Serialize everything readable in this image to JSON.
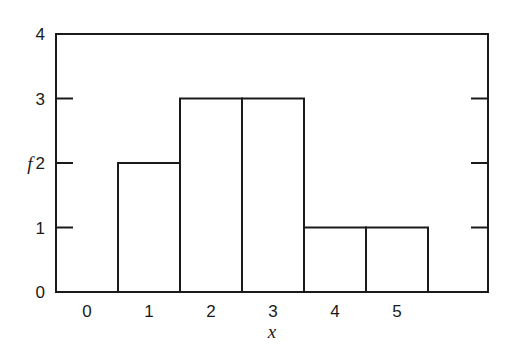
{
  "chart_data": {
    "type": "bar",
    "subtype": "histogram",
    "title": "",
    "xlabel": "x",
    "ylabel": "f",
    "categories": [
      "1",
      "2",
      "3",
      "4",
      "5"
    ],
    "values": [
      2,
      3,
      3,
      1,
      1
    ],
    "x_tick_labels": [
      "0",
      "1",
      "2",
      "3",
      "4",
      "5"
    ],
    "y_tick_labels": [
      "0",
      "1",
      "2",
      "3",
      "4"
    ],
    "ylim": [
      0,
      4
    ],
    "xlim": [
      -0.5,
      6.5
    ],
    "grid": false,
    "legend": null,
    "bar_fill": "#ffffff",
    "line_color": "#1a1a1a"
  }
}
